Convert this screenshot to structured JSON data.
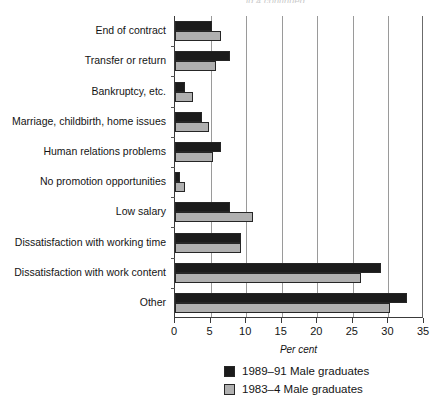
{
  "clipped_caption": "ig 4 continued",
  "chart_data": {
    "type": "bar",
    "orientation": "horizontal",
    "title": "",
    "subtitle": "",
    "xlabel": "Per cent",
    "ylabel": "",
    "xlim": [
      0,
      35
    ],
    "xticks": [
      0,
      5,
      10,
      15,
      20,
      25,
      30,
      35
    ],
    "xtick_labels": [
      "0",
      "5",
      "10",
      "15",
      "20",
      "25",
      "30",
      "35"
    ],
    "grid": true,
    "grid_axis": "x",
    "legend_position": "bottom",
    "categories": [
      "End of contract",
      "Transfer or return",
      "Bankruptcy, etc.",
      "Marriage, childbirth, home issues",
      "Human relations problems",
      "No promotion opportunities",
      "Low salary",
      "Dissatisfaction with working time",
      "Dissatisfaction with work content",
      "Other"
    ],
    "series": [
      {
        "name": "1989–91 Male graduates",
        "color": "#1b1b1b",
        "values": [
          5.2,
          7.7,
          1.4,
          3.8,
          6.4,
          0.7,
          7.7,
          9.3,
          28.9,
          32.6
        ]
      },
      {
        "name": "1983–4 Male graduates",
        "color": "#b0b0b0",
        "values": [
          6.4,
          5.7,
          2.6,
          4.8,
          5.3,
          1.4,
          11.0,
          9.3,
          26.1,
          30.2
        ]
      }
    ]
  }
}
